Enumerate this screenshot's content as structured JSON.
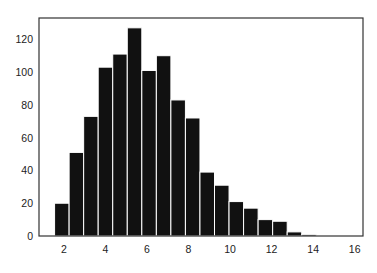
{
  "chart_data": {
    "type": "bar",
    "title": "",
    "xlabel": "",
    "ylabel": "",
    "xlim": [
      0.8,
      16.4
    ],
    "ylim": [
      0,
      133
    ],
    "grid": false,
    "legend": null,
    "bar_color": "#111111",
    "edge_color": "#ffffff",
    "bin_width": 0.7,
    "x_ticks": [
      2,
      4,
      6,
      8,
      10,
      12,
      14,
      16
    ],
    "y_ticks": [
      0,
      20,
      40,
      60,
      80,
      100,
      120
    ],
    "x": [
      1.9,
      2.6,
      3.3,
      4.0,
      4.7,
      5.4,
      6.1,
      6.8,
      7.5,
      8.2,
      8.9,
      9.6,
      10.3,
      11.0,
      11.7,
      12.4,
      13.1,
      13.8
    ],
    "values": [
      20,
      51,
      73,
      103,
      111,
      127,
      101,
      110,
      83,
      72,
      39,
      31,
      21,
      17,
      10,
      9,
      2.5,
      1
    ]
  },
  "caption": {
    "text": ""
  }
}
